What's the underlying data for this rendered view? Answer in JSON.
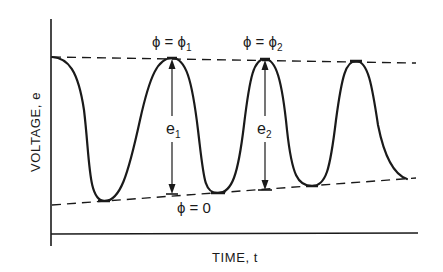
{
  "diagram": {
    "type": "waveform",
    "axes": {
      "x_label": "TIME, t",
      "y_label": "VOLTAGE, e"
    },
    "envelope": {
      "upper": {
        "from": [
          52,
          57
        ],
        "to": [
          416,
          63
        ]
      },
      "lower": {
        "from": [
          52,
          205
        ],
        "to": [
          416,
          178
        ]
      },
      "lower_label": "ϕ = 0"
    },
    "peaks": [
      {
        "x": 172,
        "y": 58,
        "label": "ϕ = ϕ",
        "subscript": "1"
      },
      {
        "x": 265,
        "y": 59,
        "label": "ϕ = ϕ",
        "subscript": "2"
      },
      {
        "x": 356,
        "y": 61
      }
    ],
    "troughs": [
      {
        "x": 104,
        "y": 201
      },
      {
        "x": 218,
        "y": 193
      },
      {
        "x": 312,
        "y": 186
      }
    ],
    "amplitude_markers": [
      {
        "label": "e",
        "subscript": "1",
        "x": 172,
        "top": 59,
        "bottom": 194
      },
      {
        "label": "e",
        "subscript": "2",
        "x": 265,
        "top": 60,
        "bottom": 190
      }
    ],
    "colors": {
      "ink": "#1a1a1a",
      "background": "#ffffff"
    }
  }
}
